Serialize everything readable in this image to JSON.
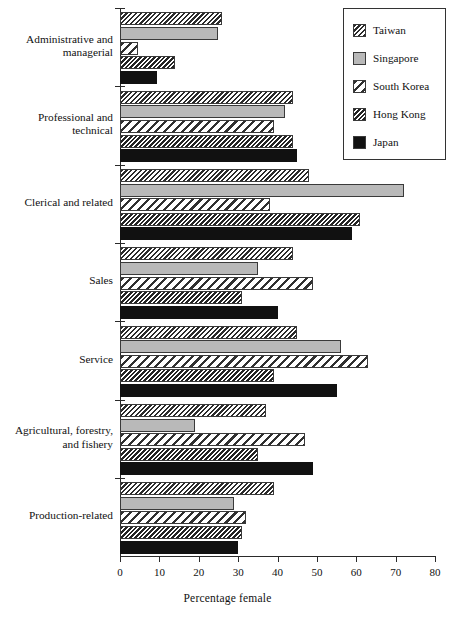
{
  "chart_data": {
    "type": "bar",
    "orientation": "horizontal",
    "title": "",
    "subtitle": "",
    "xlabel": "Percentage female",
    "ylabel": "",
    "xlim": [
      0,
      80
    ],
    "xticks": [
      0,
      10,
      20,
      30,
      40,
      50,
      60,
      70,
      80
    ],
    "xtick_labels": [
      "0",
      "10",
      "20",
      "30",
      "40",
      "50",
      "60",
      "70",
      "80"
    ],
    "grid": false,
    "legend_position": "top-right",
    "categories": [
      "Administrative and managerial",
      "Professional and technical",
      "Clerical and related",
      "Sales",
      "Service",
      "Agricultural, forestry, and fishery",
      "Production-related"
    ],
    "category_label_lines": [
      [
        "Administrative and",
        "managerial"
      ],
      [
        "Professional and",
        "technical"
      ],
      [
        "Clerical and related"
      ],
      [
        "Sales"
      ],
      [
        "Service"
      ],
      [
        "Agricultural, forestry,",
        "and fishery"
      ],
      [
        "Production-related"
      ]
    ],
    "series": [
      {
        "name": "Taiwan",
        "pattern": "dense-backslash-hatch",
        "color": "#ffffff",
        "values": [
          26,
          44,
          48,
          44,
          45,
          37,
          39
        ]
      },
      {
        "name": "Singapore",
        "pattern": "solid-gray",
        "color": "#b9b9b9",
        "values": [
          25,
          42,
          72,
          35,
          56,
          19,
          29
        ]
      },
      {
        "name": "South Korea",
        "pattern": "wide-backslash-hatch",
        "color": "#ffffff",
        "values": [
          4.5,
          39,
          38,
          49,
          63,
          47,
          32
        ]
      },
      {
        "name": "Hong Kong",
        "pattern": "very-dense-backslash-hatch",
        "color": "#ffffff",
        "values": [
          14,
          44,
          61,
          31,
          39,
          35,
          31
        ]
      },
      {
        "name": "Japan",
        "pattern": "solid-black",
        "color": "#111111",
        "values": [
          9.5,
          45,
          59,
          40,
          55,
          49,
          30
        ]
      }
    ]
  },
  "legend": {
    "items": [
      {
        "label": "Taiwan",
        "swatch": "taiwan-swatch"
      },
      {
        "label": "Singapore",
        "swatch": "singapore-swatch"
      },
      {
        "label": "South Korea",
        "swatch": "south-korea-swatch"
      },
      {
        "label": "Hong Kong",
        "swatch": "hong-kong-swatch"
      },
      {
        "label": "Japan",
        "swatch": "japan-swatch"
      }
    ]
  }
}
